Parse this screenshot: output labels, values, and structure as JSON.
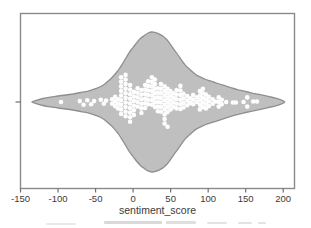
{
  "figure": {
    "background": "#ffffff"
  },
  "chart_data": {
    "type": "violin+swarm",
    "orientation": "horizontal",
    "title": "",
    "xlabel": "sentiment_score",
    "ylabel": "",
    "xlim": [
      -150,
      215
    ],
    "grid": false,
    "legend": false,
    "xtick_values": [
      -150,
      -100,
      -50,
      0,
      50,
      100,
      150,
      200
    ],
    "xticks": [
      "-150",
      "-100",
      "-50",
      "0",
      "50",
      "100",
      "150",
      "200"
    ],
    "yticks": [
      ""
    ],
    "colors": {
      "violin_fill": "#bfbfbf",
      "violin_stroke": "#8f8f8f",
      "dot_fill": "#fdfdfd",
      "axis": "#8a8a8a",
      "tick": "#6f6f6f",
      "text": "#3a3a3a"
    },
    "violin_profile": [
      [
        -135,
        0
      ],
      [
        -130,
        0.02
      ],
      [
        -120,
        0.05
      ],
      [
        -110,
        0.07
      ],
      [
        -100,
        0.085
      ],
      [
        -90,
        0.1
      ],
      [
        -80,
        0.115
      ],
      [
        -70,
        0.135
      ],
      [
        -60,
        0.155
      ],
      [
        -50,
        0.19
      ],
      [
        -40,
        0.24
      ],
      [
        -30,
        0.33
      ],
      [
        -25,
        0.385
      ],
      [
        -20,
        0.45
      ],
      [
        -15,
        0.53
      ],
      [
        -10,
        0.62
      ],
      [
        -5,
        0.71
      ],
      [
        0,
        0.78
      ],
      [
        5,
        0.85
      ],
      [
        10,
        0.91
      ],
      [
        15,
        0.95
      ],
      [
        20,
        0.985
      ],
      [
        25,
        1.0
      ],
      [
        30,
        0.99
      ],
      [
        35,
        0.97
      ],
      [
        40,
        0.94
      ],
      [
        45,
        0.89
      ],
      [
        50,
        0.82
      ],
      [
        55,
        0.74
      ],
      [
        60,
        0.67
      ],
      [
        65,
        0.59
      ],
      [
        70,
        0.52
      ],
      [
        75,
        0.47
      ],
      [
        80,
        0.42
      ],
      [
        85,
        0.38
      ],
      [
        90,
        0.355
      ],
      [
        95,
        0.33
      ],
      [
        100,
        0.31
      ],
      [
        110,
        0.275
      ],
      [
        120,
        0.24
      ],
      [
        130,
        0.205
      ],
      [
        140,
        0.175
      ],
      [
        150,
        0.15
      ],
      [
        160,
        0.125
      ],
      [
        170,
        0.105
      ],
      [
        180,
        0.08
      ],
      [
        190,
        0.055
      ],
      [
        197,
        0.03
      ],
      [
        202,
        0
      ]
    ],
    "points": [
      [
        -96,
        0
      ],
      [
        -71,
        -0.2
      ],
      [
        -66,
        0.6
      ],
      [
        -61,
        -0.4
      ],
      [
        -56,
        0.5
      ],
      [
        -52,
        -0.2
      ],
      [
        -43,
        -0.5
      ],
      [
        -39,
        0.4
      ],
      [
        -36,
        -0.3
      ],
      [
        -28,
        -0.6
      ],
      [
        -28,
        0.4
      ],
      [
        -24,
        -1.1
      ],
      [
        -24,
        -0.1
      ],
      [
        -24,
        0.9
      ],
      [
        -20,
        -0.6
      ],
      [
        -20,
        0.4
      ],
      [
        -20,
        1.4
      ],
      [
        -16,
        -5.4
      ],
      [
        -16,
        -4.4
      ],
      [
        -16,
        -3.4
      ],
      [
        -16,
        -2.4
      ],
      [
        -16,
        -1.4
      ],
      [
        -16,
        -0.4
      ],
      [
        -16,
        0.6
      ],
      [
        -16,
        1.6
      ],
      [
        -16,
        2.6
      ],
      [
        -10,
        -5.9
      ],
      [
        -10,
        -4.9
      ],
      [
        -10,
        -3.9
      ],
      [
        -10,
        -2.9
      ],
      [
        -10,
        -1.9
      ],
      [
        -10,
        -0.9
      ],
      [
        -10,
        0.1
      ],
      [
        -10,
        1.1
      ],
      [
        -10,
        2.1
      ],
      [
        -10,
        3.1
      ],
      [
        -4,
        -3.7
      ],
      [
        -4,
        -2.7
      ],
      [
        -4,
        -1.7
      ],
      [
        -4,
        -0.7
      ],
      [
        -4,
        0.3
      ],
      [
        -4,
        1.3
      ],
      [
        -4,
        2.3
      ],
      [
        -4,
        3.3
      ],
      [
        -4,
        4.3
      ],
      [
        1,
        -2.2
      ],
      [
        1,
        -1.2
      ],
      [
        1,
        -0.2
      ],
      [
        1,
        0.8
      ],
      [
        1,
        1.8
      ],
      [
        1,
        2.8
      ],
      [
        6,
        -3.0
      ],
      [
        6,
        -2.0
      ],
      [
        6,
        -1.0
      ],
      [
        6,
        0.0
      ],
      [
        6,
        1.0
      ],
      [
        11,
        -2.6
      ],
      [
        11,
        -1.6
      ],
      [
        11,
        -0.6
      ],
      [
        11,
        0.4
      ],
      [
        11,
        1.4
      ],
      [
        11,
        2.4
      ],
      [
        16,
        -3.7
      ],
      [
        16,
        -2.7
      ],
      [
        16,
        -1.7
      ],
      [
        16,
        -0.7
      ],
      [
        16,
        0.3
      ],
      [
        16,
        1.3
      ],
      [
        20,
        -4.5
      ],
      [
        20,
        -3.5
      ],
      [
        20,
        -2.5
      ],
      [
        20,
        -1.5
      ],
      [
        20,
        -0.5
      ],
      [
        20,
        0.5
      ],
      [
        25,
        -5.4
      ],
      [
        25,
        -4.4
      ],
      [
        25,
        -3.4
      ],
      [
        25,
        -2.4
      ],
      [
        25,
        -1.4
      ],
      [
        25,
        -0.4
      ],
      [
        25,
        0.6
      ],
      [
        29,
        -4.9
      ],
      [
        29,
        -3.9
      ],
      [
        29,
        -2.9
      ],
      [
        29,
        -1.9
      ],
      [
        29,
        -0.9
      ],
      [
        29,
        0.1
      ],
      [
        29,
        1.1
      ],
      [
        33,
        -3.0
      ],
      [
        33,
        -2.0
      ],
      [
        33,
        -1.0
      ],
      [
        33,
        0.0
      ],
      [
        33,
        1.0
      ],
      [
        33,
        2.0
      ],
      [
        37,
        -3.9
      ],
      [
        37,
        -2.9
      ],
      [
        37,
        -1.9
      ],
      [
        37,
        -0.9
      ],
      [
        37,
        0.1
      ],
      [
        37,
        1.1
      ],
      [
        37,
        2.1
      ],
      [
        42,
        -3.4
      ],
      [
        42,
        -2.4
      ],
      [
        42,
        -1.4
      ],
      [
        42,
        -0.4
      ],
      [
        42,
        0.6
      ],
      [
        42,
        1.6
      ],
      [
        42,
        2.7
      ],
      [
        42,
        3.7
      ],
      [
        42,
        4.7
      ],
      [
        46,
        -2.9
      ],
      [
        46,
        -1.9
      ],
      [
        46,
        -0.9
      ],
      [
        46,
        0.1
      ],
      [
        46,
        1.1
      ],
      [
        46,
        2.2
      ],
      [
        46,
        5.4
      ],
      [
        50,
        -2.4
      ],
      [
        50,
        -1.4
      ],
      [
        50,
        -0.4
      ],
      [
        50,
        0.6
      ],
      [
        50,
        1.6
      ],
      [
        54,
        -1.9
      ],
      [
        54,
        -0.9
      ],
      [
        54,
        0.1
      ],
      [
        54,
        1.1
      ],
      [
        58,
        -2.6
      ],
      [
        58,
        -1.6
      ],
      [
        58,
        -0.6
      ],
      [
        58,
        0.4
      ],
      [
        58,
        1.4
      ],
      [
        63,
        -3.5
      ],
      [
        63,
        -2.5
      ],
      [
        63,
        -1.5
      ],
      [
        63,
        -0.5
      ],
      [
        63,
        0.5
      ],
      [
        63,
        1.5
      ],
      [
        67,
        -1.8
      ],
      [
        67,
        -0.8
      ],
      [
        67,
        0.2
      ],
      [
        67,
        1.2
      ],
      [
        72,
        -1.3
      ],
      [
        72,
        -0.3
      ],
      [
        72,
        0.7
      ],
      [
        76,
        -0.8
      ],
      [
        76,
        0.2
      ],
      [
        80,
        -1.5
      ],
      [
        80,
        -0.5
      ],
      [
        80,
        0.5
      ],
      [
        85,
        -1.0
      ],
      [
        85,
        0.0
      ],
      [
        89,
        -2.4
      ],
      [
        89,
        -1.4
      ],
      [
        89,
        -0.4
      ],
      [
        89,
        0.6
      ],
      [
        89,
        1.6
      ],
      [
        93,
        -2.9
      ],
      [
        93,
        -1.9
      ],
      [
        93,
        -0.9
      ],
      [
        93,
        0.1
      ],
      [
        93,
        1.1
      ],
      [
        97,
        -1.6
      ],
      [
        97,
        -0.6
      ],
      [
        97,
        0.4
      ],
      [
        97,
        1.4
      ],
      [
        101,
        -1.1
      ],
      [
        101,
        -0.1
      ],
      [
        101,
        0.9
      ],
      [
        106,
        -0.6
      ],
      [
        106,
        0.4
      ],
      [
        110,
        -0.1
      ],
      [
        114,
        -1.0
      ],
      [
        114,
        0.0
      ],
      [
        114,
        1.0
      ],
      [
        118,
        -0.5
      ],
      [
        118,
        0.5
      ],
      [
        124,
        0.0
      ],
      [
        133,
        0.1
      ],
      [
        137,
        0.1
      ],
      [
        147,
        0.0
      ],
      [
        152,
        -1.0
      ],
      [
        152,
        1.0
      ],
      [
        160,
        -0.1
      ],
      [
        165,
        -0.1
      ]
    ]
  }
}
